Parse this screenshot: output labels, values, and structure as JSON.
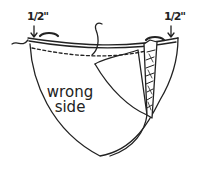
{
  "diagram": {
    "labels": {
      "left_measure": "1/2\"",
      "right_measure": "1/2\"",
      "fabric_line1": "wrong",
      "fabric_line2": "side"
    },
    "colors": {
      "ink": "#222222",
      "background": "#ffffff"
    }
  }
}
